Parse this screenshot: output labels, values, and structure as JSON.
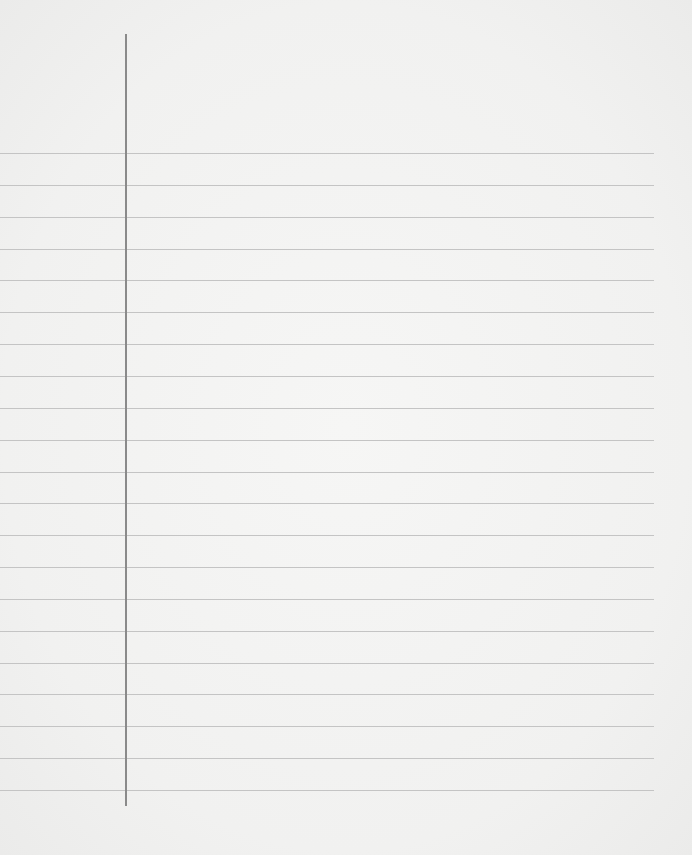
{
  "paper": {
    "type": "lined-notebook-page",
    "background_color": "#f3f3f2",
    "rule_color": "#c4c4c4",
    "margin_color": "#8a8a8a",
    "rule_count": 21,
    "first_rule_y": 153,
    "rule_spacing": 31.85,
    "rule_right_edge": 654,
    "margin_x": 125,
    "margin_top": 34,
    "margin_bottom": 806
  }
}
